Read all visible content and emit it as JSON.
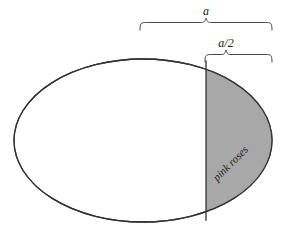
{
  "figure": {
    "background_color": "#ffffff",
    "shape": {
      "type": "ellipse",
      "outline_color": "#333333",
      "fill_color": "#ffffff",
      "center_x": 143,
      "center_y": 140.5,
      "radius_x": 129,
      "radius_y": 81.5
    },
    "shaded_region": {
      "label": "pink roses",
      "fill_color": "#a8a8a8",
      "outline_color": "#333333",
      "chord_x": 206,
      "label_rotation_degrees": -45,
      "label_x": 233,
      "label_y": 166
    },
    "dimensions": [
      {
        "name": "full-width-brace",
        "label": "a",
        "start_x": 140,
        "end_x": 272,
        "brace_y": 22,
        "label_x": 206,
        "label_y": 15
      },
      {
        "name": "half-width-brace",
        "label": "a/2",
        "start_x": 205,
        "end_x": 272,
        "brace_y": 54,
        "label_x": 226,
        "label_y": 47
      }
    ]
  }
}
